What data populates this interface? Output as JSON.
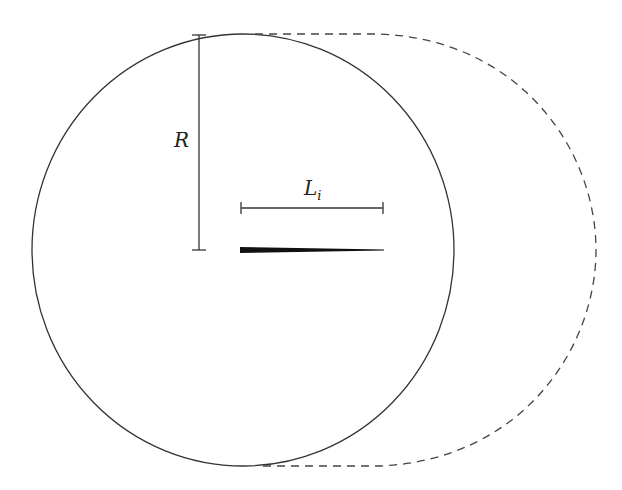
{
  "diagram": {
    "labels": {
      "radius": "R",
      "length_main": "L",
      "length_sub": "i"
    },
    "colors": {
      "stroke": "#333333",
      "crack_fill": "#111111",
      "background": "#ffffff"
    },
    "elements": {
      "circle": {
        "cx": 243,
        "cy": 250,
        "rx": 211,
        "ry": 216,
        "style": "solid"
      },
      "dashed_envelope": {
        "style": "dashed",
        "top_y": 34,
        "bottom_y": 466,
        "rightmost_x": 595
      },
      "radius_dimension": {
        "x": 199,
        "y_top": 35,
        "y_bottom": 250
      },
      "length_dimension": {
        "x_start": 241,
        "x_end": 383,
        "y": 208
      },
      "crack": {
        "x_start": 240,
        "x_end": 384,
        "y": 250,
        "max_thickness": 5
      }
    }
  }
}
